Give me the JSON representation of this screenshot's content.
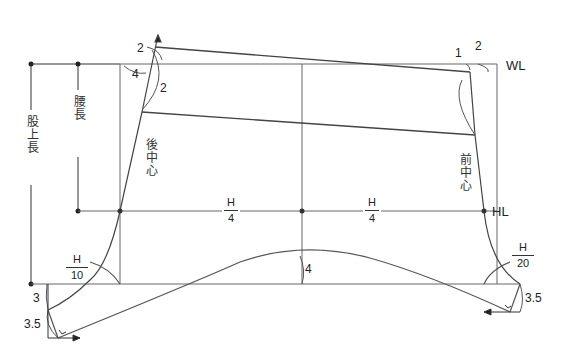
{
  "diagram": {
    "type": "pants pattern drafting diagram",
    "line_labels": {
      "waist_line": "WL",
      "hip_line": "HL"
    },
    "vertical_dimensions": {
      "crotch_depth": "股上長",
      "hip_depth": "腰長"
    },
    "center_labels": {
      "back_center": "後中心",
      "front_center": "前中心"
    },
    "measurements": {
      "back_top_rise": "2",
      "back_waist_in": "4",
      "back_arc": "2",
      "front_waist_in": "1",
      "front_rise": "2",
      "center_curve_depth": "4",
      "back_crotch_drop": "3",
      "back_extension_drop": "3.5",
      "front_extension_drop": "3.5"
    },
    "fractions": {
      "back_hip": {
        "num": "H",
        "den": "4"
      },
      "front_hip": {
        "num": "H",
        "den": "4"
      },
      "back_crotch": {
        "num": "H",
        "den": "10"
      },
      "front_crotch": {
        "num": "H",
        "den": "20"
      }
    },
    "colors": {
      "line": "#555555",
      "dark_line": "#333333",
      "text": "#222222"
    }
  }
}
